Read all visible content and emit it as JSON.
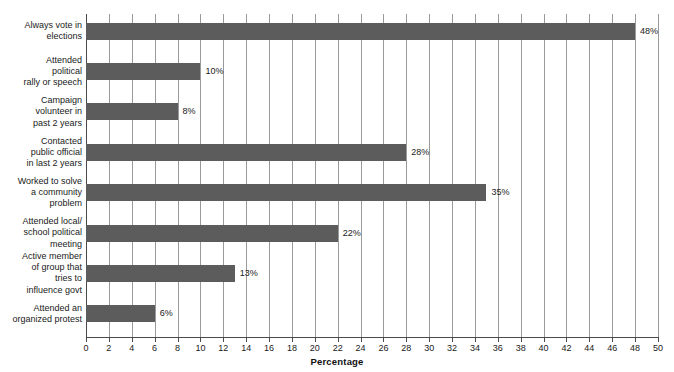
{
  "chart_data": {
    "type": "bar",
    "orientation": "horizontal",
    "title": "",
    "xlabel": "Percentage",
    "ylabel": "",
    "xlim": [
      0,
      50
    ],
    "xticks": [
      0,
      2,
      4,
      6,
      8,
      10,
      12,
      14,
      16,
      18,
      20,
      22,
      24,
      26,
      28,
      30,
      32,
      34,
      36,
      38,
      40,
      42,
      44,
      46,
      48,
      50
    ],
    "grid": "vertical",
    "legend": "none",
    "bar_color": "#5c5c5c",
    "categories": [
      "Always vote in elections",
      "Attended political rally or speech",
      "Campaign volunteer in past 2 years",
      "Contacted public official in last 2 years",
      "Worked to solve a community problem",
      "Attended local/ school political meeting",
      "Active member of group that tries to influence govt",
      "Attended an organized protest"
    ],
    "category_lines": [
      [
        "Always vote in",
        "elections"
      ],
      [
        "Attended",
        "political",
        "rally or speech"
      ],
      [
        "Campaign",
        "volunteer in",
        "past 2 years"
      ],
      [
        "Contacted",
        "public official",
        "in last 2 years"
      ],
      [
        "Worked to solve",
        "a community",
        "problem"
      ],
      [
        "Attended local/",
        "school political",
        "meeting"
      ],
      [
        "Active member",
        "of group that",
        "tries to",
        "influence govt"
      ],
      [
        "Attended an",
        "organized protest"
      ]
    ],
    "values": [
      48,
      10,
      8,
      28,
      35,
      22,
      13,
      6
    ],
    "value_labels": [
      "48%",
      "10%",
      "8%",
      "28%",
      "35%",
      "22%",
      "13%",
      "6%"
    ]
  }
}
